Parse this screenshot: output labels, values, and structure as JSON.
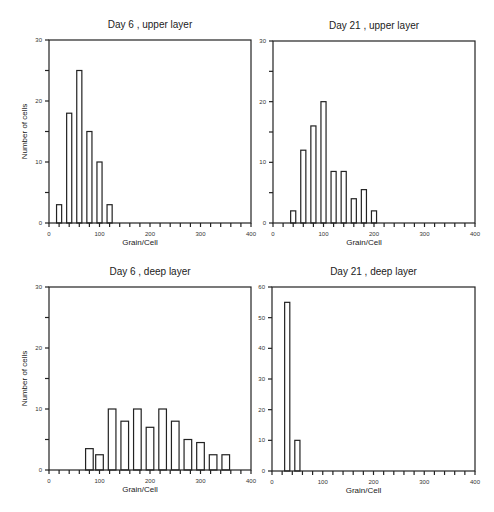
{
  "page": {
    "number": ""
  },
  "chart_data": [
    {
      "type": "bar",
      "title": "Day 6 , upper layer",
      "xlabel": "Grain/Cell",
      "ylabel": "Number of cells",
      "xlim": [
        0,
        400
      ],
      "ylim": [
        0,
        30
      ],
      "xticks": [
        0,
        100,
        200,
        300,
        400
      ],
      "yticks": [
        0,
        10,
        20,
        30
      ],
      "bin_width": 20,
      "categories": [
        20,
        40,
        60,
        80,
        100,
        120
      ],
      "values": [
        3,
        18,
        25,
        15,
        10,
        3
      ],
      "grid": false,
      "legend": null
    },
    {
      "type": "bar",
      "title": "Day 21 , upper layer",
      "xlabel": "Grain/Cell",
      "ylabel": "",
      "xlim": [
        0,
        400
      ],
      "ylim": [
        0,
        30
      ],
      "xticks": [
        0,
        100,
        200,
        300,
        400
      ],
      "yticks": [
        0,
        10,
        20,
        30
      ],
      "bin_width": 20,
      "categories": [
        40,
        60,
        80,
        100,
        120,
        140,
        160,
        180,
        200
      ],
      "values": [
        2,
        12,
        16,
        20,
        8.5,
        8.5,
        4,
        5.5,
        2
      ],
      "grid": false,
      "legend": null
    },
    {
      "type": "bar",
      "title": "Day 6 , deep layer",
      "xlabel": "Grain/Cell",
      "ylabel": "Number of cells",
      "xlim": [
        0,
        400
      ],
      "ylim": [
        0,
        30
      ],
      "xticks": [
        0,
        100,
        200,
        300,
        400
      ],
      "yticks": [
        0,
        10,
        20,
        30
      ],
      "bin_width": 25,
      "categories": [
        80,
        100,
        125,
        150,
        175,
        200,
        225,
        250,
        275,
        300,
        325,
        350
      ],
      "values": [
        3.5,
        2.5,
        10,
        8,
        10,
        7,
        10,
        8,
        5,
        4.5,
        2.5,
        2.5
      ],
      "grid": false,
      "legend": null
    },
    {
      "type": "bar",
      "title": "Day 21 , deep layer",
      "xlabel": "Grain/Cell",
      "ylabel": "",
      "xlim": [
        0,
        400
      ],
      "ylim": [
        0,
        60
      ],
      "xticks": [
        0,
        100,
        200,
        300,
        400
      ],
      "yticks": [
        0,
        10,
        20,
        30,
        40,
        50,
        60
      ],
      "bin_width": 20,
      "categories": [
        30,
        50
      ],
      "values": [
        55,
        10
      ],
      "grid": false,
      "legend": null
    }
  ],
  "panels": [
    {
      "left": 49,
      "top": 40,
      "width": 202,
      "height": 183,
      "tick_step": 20,
      "minor_y": 5
    },
    {
      "left": 273,
      "top": 41,
      "width": 202,
      "height": 182,
      "tick_step": 20,
      "minor_y": 5
    },
    {
      "left": 49,
      "top": 287,
      "width": 202,
      "height": 183,
      "tick_step": 20,
      "minor_y": 5
    },
    {
      "left": 272,
      "top": 287,
      "width": 203,
      "height": 184,
      "tick_step": 20,
      "minor_y": 10
    }
  ]
}
